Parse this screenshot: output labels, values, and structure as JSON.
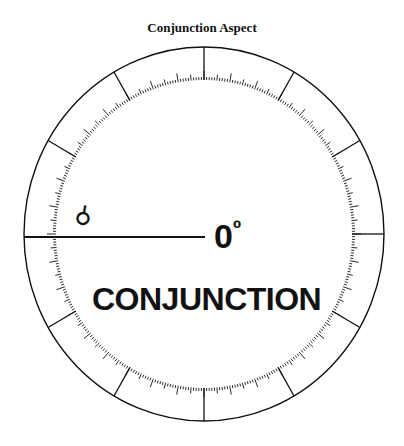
{
  "title": "Conjunction Aspect",
  "symbol": "☌",
  "angle_value": "0",
  "angle_unit": "º",
  "label": "CONJUNCTION",
  "dial": {
    "center": [
      204,
      234
    ],
    "outer_radius": [
      180,
      187
    ],
    "inner_radius": [
      148,
      154
    ],
    "spoke_interval_deg": 30,
    "tick_minor_deg": 1,
    "tick_major_deg": 5,
    "aspect_angle_deg": 0,
    "color": "#111111"
  }
}
